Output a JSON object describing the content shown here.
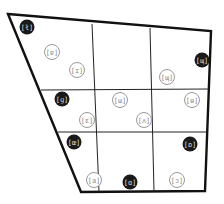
{
  "diagram": {
    "title": "",
    "grid": {
      "rows": 3,
      "cols": 3
    },
    "colors": {
      "outline": "#111111",
      "divider": "#222222",
      "filled": "#1a1a1a",
      "open_stroke": "#9a9a9a",
      "open_text": "#8a8a8a",
      "filled_text": "#dddddd"
    },
    "markers": [
      {
        "row": 0,
        "col": 0,
        "style": "filled",
        "label": "[ł]"
      },
      {
        "row": 0,
        "col": 0,
        "style": "open",
        "label": "[ɐ]"
      },
      {
        "row": 0,
        "col": 0,
        "style": "open",
        "label": "[ɪ]"
      },
      {
        "row": 0,
        "col": 2,
        "style": "filled",
        "label": "[ɰ]"
      },
      {
        "row": 0,
        "col": 2,
        "style": "open",
        "label": "[ɰ]"
      },
      {
        "row": 1,
        "col": 0,
        "style": "filled",
        "label": "[ɡ]"
      },
      {
        "row": 1,
        "col": 1,
        "style": "open",
        "label": "[ɯ]"
      },
      {
        "row": 1,
        "col": 2,
        "style": "open",
        "label": "[ɵ]"
      },
      {
        "row": 1,
        "col": 0,
        "style": "open",
        "label": "[ɛ]"
      },
      {
        "row": 1,
        "col": 1,
        "style": "open",
        "label": "[ʌ]"
      },
      {
        "row": 2,
        "col": 0,
        "style": "filled",
        "label": "[œ]"
      },
      {
        "row": 2,
        "col": 2,
        "style": "filled",
        "label": "[ɒ]"
      },
      {
        "row": 2,
        "col": 0,
        "style": "open",
        "label": "[a]"
      },
      {
        "row": 2,
        "col": 1,
        "style": "filled",
        "label": "[ɑ]"
      },
      {
        "row": 2,
        "col": 2,
        "style": "open",
        "label": "[ɔ]"
      }
    ]
  }
}
